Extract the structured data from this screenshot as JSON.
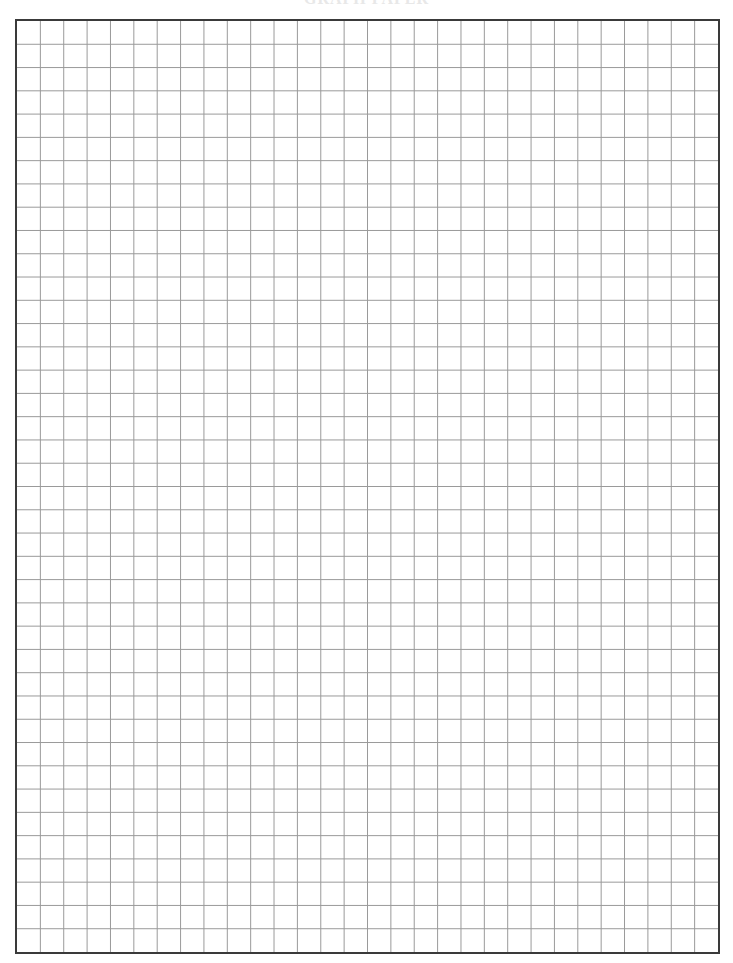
{
  "page": {
    "title": "GRAPH PAPER",
    "title_visible": "partially cut off at top edge"
  },
  "grid": {
    "columns": 30,
    "rows": 40,
    "line_color": "#9a9a9a",
    "border_color": "#3a3a3a",
    "background_color": "#ffffff"
  }
}
